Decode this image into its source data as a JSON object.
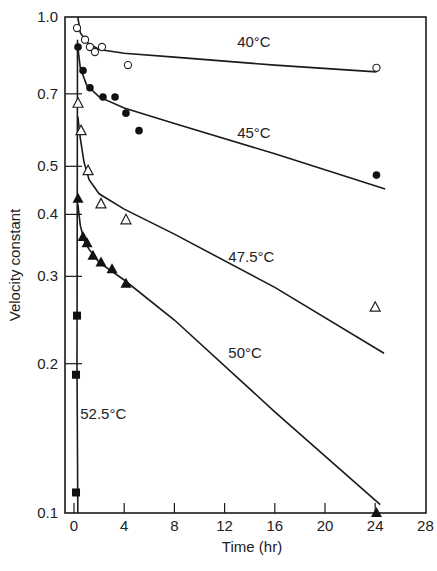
{
  "chart_data": {
    "type": "scatter",
    "title": "",
    "xlabel": "Time (hr)",
    "ylabel": "Velocity constant",
    "xlim": [
      0,
      28
    ],
    "ylim": [
      0.1,
      1.0
    ],
    "yscale": "log",
    "grid": false,
    "legend": "inline labels next to curves",
    "x_ticks": [
      0,
      4,
      8,
      12,
      16,
      20,
      24,
      28
    ],
    "x_tick_labels": [
      "0",
      "4",
      "8",
      "12",
      "16",
      "20",
      "24",
      "28"
    ],
    "y_ticks": [
      0.1,
      0.2,
      0.3,
      0.4,
      0.5,
      0.7,
      1.0
    ],
    "y_tick_labels": [
      "0.1",
      "0.2",
      "0.3",
      "0.4",
      "0.5",
      "0.7",
      "1.0"
    ],
    "series": [
      {
        "name": "40°C",
        "marker": "open-circle",
        "points": [
          [
            0.24,
            0.95
          ],
          [
            0.88,
            0.9
          ],
          [
            1.27,
            0.87
          ],
          [
            1.67,
            0.85
          ],
          [
            2.23,
            0.87
          ],
          [
            4.3,
            0.8
          ],
          [
            24.1,
            0.79
          ]
        ],
        "curve": [
          [
            0.3,
            1.0
          ],
          [
            0.5,
            0.93
          ],
          [
            1.0,
            0.89
          ],
          [
            2.0,
            0.86
          ],
          [
            4.0,
            0.845
          ],
          [
            8.0,
            0.83
          ],
          [
            16.0,
            0.8
          ],
          [
            24.1,
            0.775
          ]
        ],
        "label_pos": [
          13.0,
          0.87
        ]
      },
      {
        "name": "45°C",
        "marker": "filled-circle",
        "points": [
          [
            0.32,
            0.87
          ],
          [
            0.72,
            0.78
          ],
          [
            1.27,
            0.72
          ],
          [
            2.31,
            0.69
          ],
          [
            3.27,
            0.69
          ],
          [
            4.14,
            0.64
          ],
          [
            5.18,
            0.59
          ],
          [
            24.1,
            0.48
          ]
        ],
        "curve": [
          [
            0.3,
            0.87
          ],
          [
            0.5,
            0.79
          ],
          [
            1.0,
            0.73
          ],
          [
            2.0,
            0.69
          ],
          [
            4.0,
            0.655
          ],
          [
            8.0,
            0.61
          ],
          [
            16.0,
            0.53
          ],
          [
            24.8,
            0.45
          ]
        ],
        "label_pos": [
          13.0,
          0.57
        ]
      },
      {
        "name": "47.5°C",
        "marker": "open-triangle",
        "points": [
          [
            0.32,
            0.67
          ],
          [
            0.56,
            0.59
          ],
          [
            1.12,
            0.49
          ],
          [
            2.15,
            0.42
          ],
          [
            4.14,
            0.39
          ],
          [
            24.0,
            0.26
          ]
        ],
        "curve": [
          [
            0.3,
            0.63
          ],
          [
            0.5,
            0.57
          ],
          [
            0.8,
            0.51
          ],
          [
            1.2,
            0.47
          ],
          [
            2.0,
            0.44
          ],
          [
            4.0,
            0.41
          ],
          [
            8.0,
            0.365
          ],
          [
            16.0,
            0.285
          ],
          [
            24.7,
            0.21
          ]
        ],
        "label_pos": [
          12.3,
          0.32
        ]
      },
      {
        "name": "50°C",
        "marker": "filled-triangle",
        "points": [
          [
            0.32,
            0.43
          ],
          [
            0.72,
            0.36
          ],
          [
            1.04,
            0.35
          ],
          [
            1.51,
            0.33
          ],
          [
            2.15,
            0.32
          ],
          [
            3.03,
            0.31
          ],
          [
            4.14,
            0.29
          ],
          [
            24.1,
            0.1
          ]
        ],
        "curve": [
          [
            0.3,
            0.42
          ],
          [
            0.5,
            0.38
          ],
          [
            0.8,
            0.355
          ],
          [
            1.2,
            0.34
          ],
          [
            2.0,
            0.32
          ],
          [
            4.0,
            0.295
          ],
          [
            8.0,
            0.245
          ],
          [
            16.0,
            0.16
          ],
          [
            24.4,
            0.104
          ]
        ],
        "label_pos": [
          12.3,
          0.205
        ]
      },
      {
        "name": "52.5°C",
        "marker": "filled-square",
        "points": [
          [
            0.24,
            0.25
          ],
          [
            0.16,
            0.19
          ],
          [
            0.16,
            0.11
          ]
        ],
        "curve": [
          [
            0.28,
            0.9
          ],
          [
            0.26,
            0.5
          ],
          [
            0.24,
            0.2
          ],
          [
            0.3,
            0.1
          ]
        ],
        "label_pos": [
          0.5,
          0.155
        ]
      }
    ]
  }
}
